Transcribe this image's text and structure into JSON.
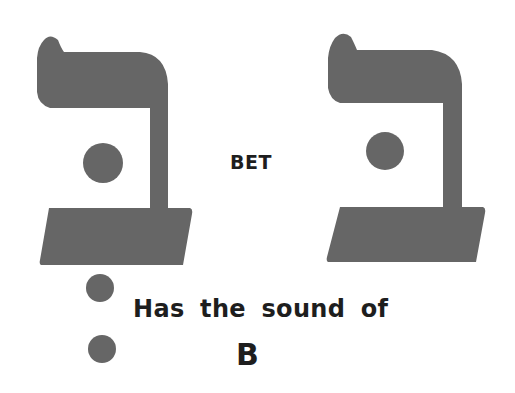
{
  "letters": {
    "left": {
      "name": "bet-with-dagesh",
      "color": "#666666",
      "has_inner_dot": true,
      "has_vowel_dots": true
    },
    "right": {
      "name": "bet-with-dagesh",
      "color": "#666666",
      "has_inner_dot": true,
      "has_vowel_dots": false
    }
  },
  "text": {
    "letter_name": "BET",
    "description": "Has the sound of",
    "sound": "B"
  },
  "colors": {
    "glyph": "#666666",
    "text": "#1e1e1e",
    "background": "#ffffff"
  }
}
